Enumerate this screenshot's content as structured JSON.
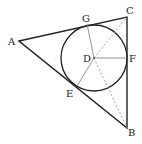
{
  "diagram": {
    "points": {
      "A": {
        "label": "A",
        "x": 19,
        "y": 41
      },
      "B": {
        "label": "B",
        "x": 127,
        "y": 128
      },
      "C": {
        "label": "C",
        "x": 127,
        "y": 17
      },
      "D": {
        "label": "D",
        "x": 94,
        "y": 58
      },
      "E": {
        "label": "E",
        "x": 77,
        "y": 86
      },
      "F": {
        "label": "F",
        "x": 127,
        "y": 58
      },
      "G": {
        "label": "G",
        "x": 87,
        "y": 24
      }
    },
    "circle": {
      "center": "D",
      "radius": 33
    },
    "colors": {
      "triangle": "#222222",
      "circle": "#222222",
      "radius": "#888888",
      "dashed": "#999999",
      "label": "#222222"
    }
  }
}
